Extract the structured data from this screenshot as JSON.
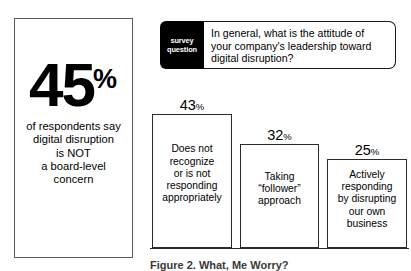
{
  "stat_panel": {
    "number": "45",
    "percent_symbol": "%",
    "caption_lines": [
      "of respondents say",
      "digital disruption",
      "is NOT",
      "a board-level",
      "concern"
    ]
  },
  "survey_callout": {
    "tag_line_1": "survey",
    "tag_line_2": "question",
    "question_lines": [
      "In general, what is the attitude of",
      "your company's leadership toward",
      "digital disruption?"
    ]
  },
  "figure_caption": "Figure 2. What, Me Worry?",
  "chart_data": {
    "type": "bar",
    "title": "",
    "xlabel": "",
    "ylabel": "",
    "ylim": [
      0,
      50
    ],
    "grid": false,
    "legend": "none",
    "categories": [
      "Does not recognize or is not responding appropriately",
      "Taking “follower” approach",
      "Actively responding by disrupting our own business"
    ],
    "values": [
      43,
      32,
      25
    ],
    "value_labels": [
      "43",
      "32",
      "25"
    ],
    "percent_symbol": "%",
    "bars": [
      {
        "value": "43",
        "percent": "%",
        "label_lines": [
          "Does not",
          "recognize",
          "or is not",
          "responding",
          "appropriately"
        ]
      },
      {
        "value": "32",
        "percent": "%",
        "label_lines": [
          "Taking",
          "“follower”",
          "approach"
        ]
      },
      {
        "value": "25",
        "percent": "%",
        "label_lines": [
          "Actively",
          "responding",
          "by disrupting",
          "our own",
          "business"
        ]
      }
    ]
  }
}
